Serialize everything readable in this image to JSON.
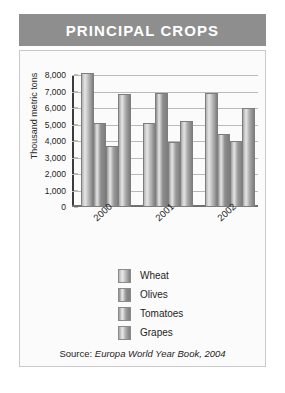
{
  "title": "PRINCIPAL CROPS",
  "source_prefix": "Source:",
  "source_text": "Europa World Year Book, 2004",
  "colors": {
    "banner": "#8e8e8e",
    "panel": "#fbfbfb",
    "grid": "#b9b9b9",
    "axis": "#3c3c3c",
    "wheat": "#b4b4b4",
    "olives": "#8d8d8d",
    "tomatoes": "#9a9a9a",
    "grapes": "#a6a6a6"
  },
  "chart_data": {
    "type": "bar",
    "title": "PRINCIPAL CROPS",
    "xlabel": "",
    "ylabel": "Thousand metric tons",
    "categories": [
      "2000",
      "2001",
      "2002"
    ],
    "ytick_labels": [
      "8,000",
      "7,000",
      "6,000",
      "5,000",
      "4,000",
      "3,000",
      "2,000",
      "1,000",
      "0"
    ],
    "ylim": [
      0,
      8000
    ],
    "ytick_step": 1000,
    "grid": true,
    "legend_position": "bottom",
    "series": [
      {
        "name": "Wheat",
        "values": [
          8000,
          5000,
          6800
        ]
      },
      {
        "name": "Olives",
        "values": [
          5000,
          6800,
          4300
        ]
      },
      {
        "name": "Tomatoes",
        "values": [
          3600,
          3800,
          3900
        ]
      },
      {
        "name": "Grapes",
        "values": [
          6700,
          5100,
          5900
        ]
      }
    ]
  }
}
